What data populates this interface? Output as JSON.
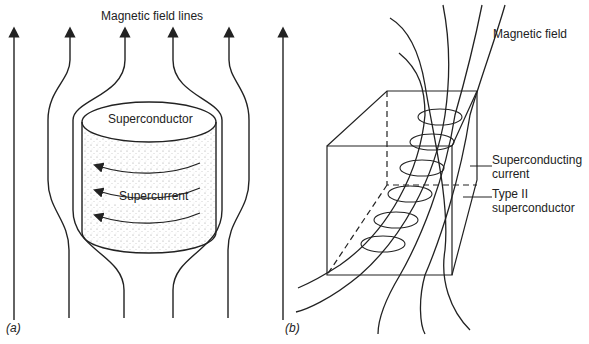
{
  "panel_a": {
    "tag": "(a)",
    "title": "Magnetic field lines",
    "body_label": "Superconductor",
    "current_label": "Supercurrent"
  },
  "panel_b": {
    "tag": "(b)",
    "field_label": "Magnetic field",
    "current_label_line1": "Superconducting",
    "current_label_line2": "current",
    "material_label_line1": "Type II",
    "material_label_line2": "superconductor"
  },
  "colors": {
    "ink": "#222222",
    "background": "#ffffff"
  }
}
